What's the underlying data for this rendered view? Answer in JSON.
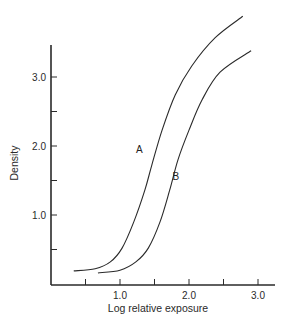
{
  "chart_data": {
    "type": "line",
    "title": "",
    "xlabel": "Log relative exposure",
    "ylabel": "Density",
    "xlim": [
      0,
      3.2
    ],
    "ylim": [
      0,
      3.5
    ],
    "x_ticks": [
      0.5,
      1.0,
      1.5,
      2.0,
      2.5,
      3.0
    ],
    "x_tick_labels": [
      "",
      "1.0",
      "",
      "2.0",
      "",
      "3.0"
    ],
    "y_ticks": [
      0.5,
      1.0,
      1.5,
      2.0,
      2.5,
      3.0
    ],
    "y_tick_labels": [
      "",
      "1.0",
      "",
      "2.0",
      "",
      "3.0"
    ],
    "grid": false,
    "legend": "none (curves labeled inline)",
    "series": [
      {
        "name": "A",
        "x": [
          0.33,
          0.64,
          0.86,
          1.03,
          1.2,
          1.36,
          1.46,
          1.61,
          1.8,
          2.04,
          2.38,
          2.78
        ],
        "y": [
          0.19,
          0.22,
          0.32,
          0.52,
          0.9,
          1.36,
          1.72,
          2.23,
          2.74,
          3.16,
          3.57,
          3.88
        ]
      },
      {
        "name": "B",
        "x": [
          0.68,
          1.0,
          1.23,
          1.41,
          1.58,
          1.72,
          1.84,
          2.0,
          2.19,
          2.45,
          2.9
        ],
        "y": [
          0.16,
          0.2,
          0.32,
          0.52,
          0.9,
          1.36,
          1.8,
          2.23,
          2.67,
          3.07,
          3.38
        ]
      }
    ],
    "annotations": [
      {
        "text": "A",
        "x": 1.28,
        "y": 1.9
      },
      {
        "text": "B",
        "x": 1.81,
        "y": 1.51
      }
    ]
  },
  "layout": {
    "origin_px": [
      51,
      284
    ],
    "px_per_unit_x": 69,
    "px_per_unit_y": 69,
    "axis_top_px": 45,
    "axis_right_px": 275,
    "line_color": "#2a2a2a"
  },
  "caption": "",
  "caption_fragment_visible": true
}
